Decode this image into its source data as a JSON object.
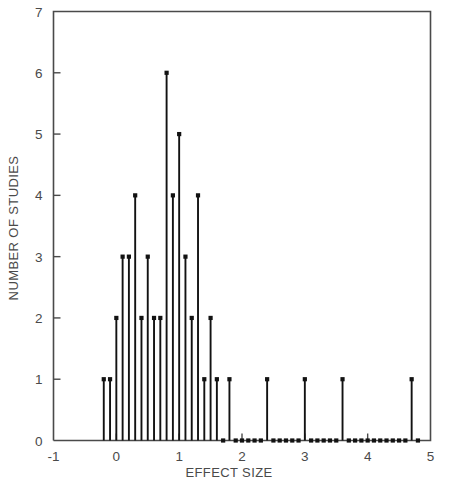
{
  "chart_data": {
    "type": "bar",
    "title": "",
    "subtitle": "",
    "xlabel": "EFFECT SIZE",
    "ylabel": "NUMBER OF STUDIES",
    "xlim": [
      -1,
      5
    ],
    "ylim": [
      0,
      7
    ],
    "xticks": [
      -1,
      0,
      1,
      2,
      3,
      4,
      5
    ],
    "xtick_labels": [
      "-1",
      "0",
      "1",
      "2",
      "3",
      "4",
      "5"
    ],
    "yticks": [
      0,
      1,
      2,
      3,
      4,
      5,
      6,
      7
    ],
    "ytick_labels": [
      "0",
      "1",
      "2",
      "3",
      "4",
      "5",
      "6",
      "7"
    ],
    "grid": false,
    "legend": null,
    "marker": "square-dot",
    "series_name": "studies",
    "x": [
      -0.2,
      -0.1,
      0.0,
      0.1,
      0.2,
      0.3,
      0.4,
      0.5,
      0.6,
      0.7,
      0.8,
      0.9,
      1.0,
      1.1,
      1.2,
      1.3,
      1.4,
      1.5,
      1.6,
      1.7,
      1.8,
      1.9,
      2.0,
      2.1,
      2.2,
      2.3,
      2.4,
      2.5,
      2.6,
      2.7,
      2.8,
      2.9,
      3.0,
      3.1,
      3.2,
      3.3,
      3.4,
      3.5,
      3.6,
      3.7,
      3.8,
      3.9,
      4.0,
      4.1,
      4.2,
      4.3,
      4.4,
      4.5,
      4.6,
      4.7,
      4.8
    ],
    "values": [
      1,
      1,
      2,
      3,
      3,
      4,
      2,
      3,
      2,
      2,
      6,
      4,
      5,
      3,
      2,
      4,
      1,
      2,
      1,
      0,
      1,
      0,
      0,
      0,
      0,
      0,
      1,
      0,
      0,
      0,
      0,
      0,
      1,
      0,
      0,
      0,
      0,
      0,
      1,
      0,
      0,
      0,
      0,
      0,
      0,
      0,
      0,
      0,
      0,
      1,
      0
    ]
  },
  "axes": {
    "x_title": "EFFECT SIZE",
    "y_title": "NUMBER OF STUDIES"
  },
  "colors": {
    "stem": "#121212",
    "axis": "#4a4a4a",
    "background": "#ffffff"
  }
}
